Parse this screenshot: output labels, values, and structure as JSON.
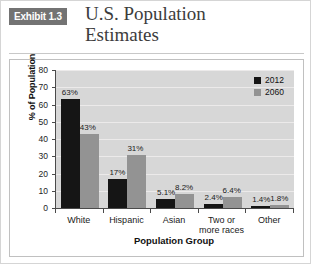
{
  "header": {
    "badge": "Exhibit 1.3",
    "title_line1": "U.S. Population",
    "title_line2": "Estimates",
    "badge_bg": "#737373",
    "badge_fg": "#ffffff"
  },
  "chart_data": {
    "type": "bar",
    "title": "U.S. Population Estimates",
    "xlabel": "Population Group",
    "ylabel": "% of Population",
    "ylim": [
      0,
      80
    ],
    "yticks": [
      0,
      10,
      20,
      30,
      40,
      50,
      60,
      70,
      80
    ],
    "grid": true,
    "legend_position": "top-right",
    "categories": [
      "White",
      "Hispanic",
      "Asian",
      "Two or\nmore races",
      "Other"
    ],
    "category_labels": [
      {
        "line1": "White",
        "line2": ""
      },
      {
        "line1": "Hispanic",
        "line2": ""
      },
      {
        "line1": "Asian",
        "line2": ""
      },
      {
        "line1": "Two or",
        "line2": "more races"
      },
      {
        "line1": "Other",
        "line2": ""
      }
    ],
    "series": [
      {
        "name": "2012",
        "color": "#151515",
        "values": [
          63,
          17,
          5.1,
          2.4,
          1.4
        ],
        "data_labels": [
          "63%",
          "17%",
          "5.1%",
          "2.4%",
          "1.4%"
        ]
      },
      {
        "name": "2060",
        "color": "#939393",
        "values": [
          43,
          31,
          8.2,
          6.4,
          1.8
        ],
        "data_labels": [
          "43%",
          "31%",
          "8.2%",
          "6.4%",
          "1.8%"
        ]
      }
    ]
  },
  "legend": {
    "items": [
      {
        "label": "2012",
        "color": "#151515"
      },
      {
        "label": "2060",
        "color": "#939393"
      }
    ]
  }
}
